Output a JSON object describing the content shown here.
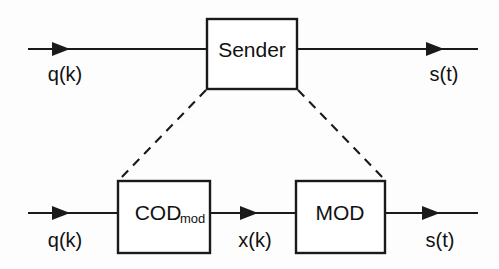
{
  "diagram": {
    "background_color": "#fdfdfd",
    "line_color": "#1a1a1a",
    "text_color": "#111111",
    "rows": [
      {
        "id": "top-row",
        "blocks": [
          {
            "id": "sender",
            "label": "Sender",
            "subscript": ""
          }
        ],
        "signals": [
          {
            "id": "top-input",
            "label": "q(k)"
          },
          {
            "id": "top-output",
            "label": "s(t)"
          }
        ]
      },
      {
        "id": "bottom-row",
        "blocks": [
          {
            "id": "coder",
            "label": "COD",
            "subscript": "mod"
          },
          {
            "id": "modulator",
            "label": "MOD",
            "subscript": ""
          }
        ],
        "signals": [
          {
            "id": "bottom-input",
            "label": "q(k)"
          },
          {
            "id": "bottom-middle",
            "label": "x(k)"
          },
          {
            "id": "bottom-output",
            "label": "s(t)"
          }
        ]
      }
    ],
    "expansion_connectors": [
      {
        "id": "left-expansion",
        "style": "dashed"
      },
      {
        "id": "right-expansion",
        "style": "dashed"
      }
    ]
  }
}
